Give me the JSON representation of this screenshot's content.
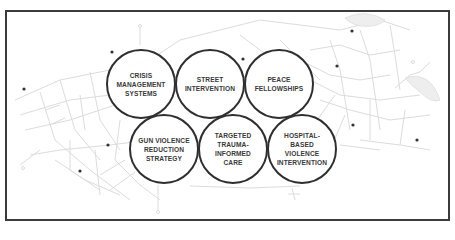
{
  "diagram": {
    "type": "overlapping-circles",
    "frame": {
      "border_color": "#3b3b3b"
    },
    "circle_border_color": "#2f2f2f",
    "text_color": "#3a3a3a",
    "background": "faint street map with dots",
    "top_row": [
      {
        "label": "CRISIS\nMANAGEMENT\nSYSTEMS"
      },
      {
        "label": "STREET\nINTERVENTION"
      },
      {
        "label": "PEACE\nFELLOWSHIPS"
      }
    ],
    "bottom_row": [
      {
        "label": "GUN VIOLENCE\nREDUCTION\nSTRATEGY"
      },
      {
        "label": "TARGETED\nTRAUMA-\nINFORMED\nCARE"
      },
      {
        "label": "HOSPITAL-\nBASED\nVIOLENCE\nINTERVENTION"
      }
    ]
  }
}
